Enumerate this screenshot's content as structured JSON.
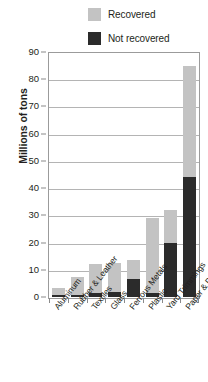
{
  "chart_data": {
    "type": "bar",
    "subtype": "stacked-vertical",
    "title": "",
    "xlabel": "",
    "ylabel": "Millions of tons",
    "ylim": [
      0,
      90
    ],
    "ytick_step": 10,
    "yticks": [
      "0",
      "10",
      "20",
      "30",
      "40",
      "50",
      "60",
      "70",
      "80",
      "90"
    ],
    "grid": true,
    "legend_position": "top-right",
    "categories": [
      "Aluminum",
      "Rubber & Leather",
      "Textiles",
      "Glass",
      "Ferrous Metals",
      "Plastic",
      "Yard Trimmings",
      "Paper & Paperboard"
    ],
    "series": [
      {
        "name": "Not recovered",
        "color": "#2b2b2b",
        "values": [
          0.8,
          0.7,
          1.5,
          2.0,
          6.5,
          1.5,
          20.0,
          44.0
        ]
      },
      {
        "name": "Recovered",
        "color": "#c3c3c3",
        "values": [
          2.5,
          6.5,
          10.5,
          10.5,
          7.0,
          27.5,
          12.0,
          41.0
        ]
      }
    ],
    "totals": [
      3.3,
      7.2,
      12.0,
      12.5,
      13.5,
      29.0,
      32.0,
      85.0
    ]
  },
  "legend": {
    "items": [
      {
        "label": "Recovered",
        "swatch": "#c3c3c3"
      },
      {
        "label": "Not recovered",
        "swatch": "#2b2b2b"
      }
    ]
  },
  "axis": {
    "y_title": "Millions of tons"
  },
  "colors": {
    "recovered": "#c3c3c3",
    "not_recovered": "#2b2b2b",
    "gridline": "#b4b4b4",
    "frame": "#9b9b9b",
    "text": "#231f20",
    "background": "#ffffff"
  }
}
